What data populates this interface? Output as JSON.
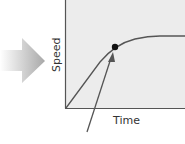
{
  "diagram": {
    "x_axis_label": "Time",
    "y_axis_label": "Speed",
    "colors": {
      "plot_background": "#ececec",
      "line": "#555555",
      "point": "#111111",
      "arrow_gradient_start": "#ffffff",
      "arrow_gradient_end": "#a8a8a8"
    },
    "curve": {
      "description": "Speed rises from origin, bends, then levels off to a plateau",
      "highlighted_point": "marked point on the bending part of the curve"
    }
  }
}
